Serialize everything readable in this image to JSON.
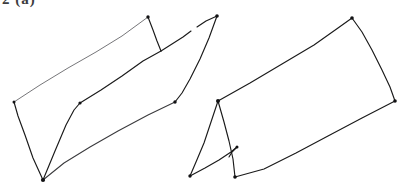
{
  "page": {
    "width": 403,
    "height": 195,
    "background_color": "#ffffff",
    "ink_color": "#1a1a1a",
    "faint_ink_color": "#6f6f72"
  },
  "header": {
    "clipped_label": "2 (a)",
    "note": "partially cropped text at top edge"
  },
  "figures": [
    {
      "name": "left-folded-prism",
      "label": "Left figure: folded parallelogram prism outline",
      "paths": [
        {
          "name": "top-left-long-edge",
          "tone": "faint",
          "points": "14,102 40,85 68,68 96,52 122,36 148,17"
        },
        {
          "name": "short-fold-segment",
          "tone": "dark",
          "points": "148,17 153,30 157,41 161,51"
        },
        {
          "name": "upper-right-edge-part-a",
          "tone": "dark",
          "points": "161,51 172,44 183,37 191,31"
        },
        {
          "name": "upper-right-edge-part-b",
          "tone": "dark",
          "points": "197,27 206,21 217,16"
        },
        {
          "name": "apex-down-right-edge",
          "tone": "dark",
          "points": "217,16 209,38 200,59 190,79 182,93 175,102"
        },
        {
          "name": "lower-right-edge",
          "tone": "dark",
          "points": "175,102 148,115 118,131 90,147 64,163 43,180"
        },
        {
          "name": "bottom-left-edge",
          "tone": "dark",
          "points": "43,180 33,158 25,135 18,116 14,102"
        },
        {
          "name": "inner-fold-line",
          "tone": "dark",
          "points": "43,180 55,151 66,125 74,110 80,103"
        },
        {
          "name": "inner-fold-upper",
          "tone": "dark",
          "points": "80,103 101,90 122,76 143,61 161,51"
        }
      ],
      "vertices": [
        {
          "name": "vertex-left",
          "x": 14,
          "y": 102
        },
        {
          "name": "vertex-top-fold",
          "x": 148,
          "y": 17
        },
        {
          "name": "vertex-fold-mid",
          "x": 161,
          "y": 51
        },
        {
          "name": "vertex-apex",
          "x": 217,
          "y": 16
        },
        {
          "name": "vertex-right-mid",
          "x": 175,
          "y": 102
        },
        {
          "name": "vertex-bottom",
          "x": 43,
          "y": 180
        },
        {
          "name": "vertex-inner-fold",
          "x": 80,
          "y": 103
        }
      ]
    },
    {
      "name": "right-folded-box",
      "label": "Right figure: parallelogram with triangular fold flap",
      "paths": [
        {
          "name": "top-edge",
          "tone": "dark",
          "points": "218,101 250,83 282,64 314,45 338,28 352,18"
        },
        {
          "name": "right-upper-edge",
          "tone": "dark",
          "points": "352,18 362,32 372,50 382,70 390,87 395,101"
        },
        {
          "name": "bottom-edge",
          "tone": "dark",
          "points": "395,101 362,118 328,136 296,153 264,169 235,177"
        },
        {
          "name": "flap-left-edge",
          "tone": "dark",
          "points": "218,101 211,122 204,143 196,162 190,176"
        },
        {
          "name": "flap-bottom-edge",
          "tone": "dark",
          "points": "190,176 205,168 219,160 231,152 237,147"
        },
        {
          "name": "flap-right-edge",
          "tone": "dark",
          "points": "218,101 224,122 229,141 233,159 235,177"
        },
        {
          "name": "flap-fold-notch",
          "tone": "dark",
          "points": "237,147 232,152 229,157"
        }
      ],
      "vertices": [
        {
          "name": "vertex-box-left",
          "x": 218,
          "y": 101
        },
        {
          "name": "vertex-box-top",
          "x": 352,
          "y": 18
        },
        {
          "name": "vertex-box-right",
          "x": 395,
          "y": 101
        },
        {
          "name": "vertex-box-bottom",
          "x": 235,
          "y": 177
        },
        {
          "name": "vertex-flap-bottom",
          "x": 190,
          "y": 176
        },
        {
          "name": "vertex-flap-notch",
          "x": 237,
          "y": 147
        }
      ]
    }
  ]
}
